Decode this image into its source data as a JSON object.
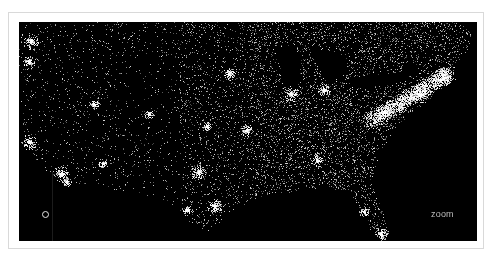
{
  "map": {
    "title": "United States city lights",
    "background_color": "#000000",
    "dot_color": "#ffffff",
    "frame_border_color": "#d9d9d9",
    "zoom_label": "zoom",
    "marker": "location-ring",
    "hotspots": [
      {
        "name": "Seattle",
        "x": 12,
        "y": 20,
        "r": 5
      },
      {
        "name": "Portland",
        "x": 10,
        "y": 40,
        "r": 4
      },
      {
        "name": "San Francisco",
        "x": 10,
        "y": 120,
        "r": 5
      },
      {
        "name": "Los Angeles",
        "x": 42,
        "y": 152,
        "r": 5
      },
      {
        "name": "San Diego",
        "x": 48,
        "y": 160,
        "r": 3
      },
      {
        "name": "Phoenix",
        "x": 84,
        "y": 142,
        "r": 3
      },
      {
        "name": "Salt Lake City",
        "x": 75,
        "y": 82,
        "r": 3
      },
      {
        "name": "Denver",
        "x": 130,
        "y": 92,
        "r": 3
      },
      {
        "name": "Minneapolis",
        "x": 210,
        "y": 52,
        "r": 4
      },
      {
        "name": "Chicago",
        "x": 272,
        "y": 72,
        "r": 5
      },
      {
        "name": "Detroit",
        "x": 305,
        "y": 68,
        "r": 4
      },
      {
        "name": "Kansas City",
        "x": 188,
        "y": 104,
        "r": 3
      },
      {
        "name": "St. Louis",
        "x": 228,
        "y": 108,
        "r": 4
      },
      {
        "name": "Dallas",
        "x": 180,
        "y": 150,
        "r": 5
      },
      {
        "name": "Houston",
        "x": 196,
        "y": 184,
        "r": 5
      },
      {
        "name": "San Antonio",
        "x": 168,
        "y": 188,
        "r": 3
      },
      {
        "name": "Atlanta",
        "x": 298,
        "y": 138,
        "r": 4
      },
      {
        "name": "Washington",
        "x": 366,
        "y": 90,
        "r": 5
      },
      {
        "name": "New York",
        "x": 400,
        "y": 72,
        "r": 6
      },
      {
        "name": "Boston",
        "x": 425,
        "y": 56,
        "r": 5
      },
      {
        "name": "Miami",
        "x": 362,
        "y": 212,
        "r": 4
      },
      {
        "name": "Tampa",
        "x": 345,
        "y": 190,
        "r": 3
      }
    ]
  }
}
